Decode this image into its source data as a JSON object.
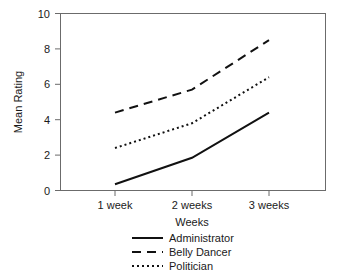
{
  "chart_data": {
    "type": "line",
    "title": "",
    "xlabel": "Weeks",
    "ylabel": "Mean Rating",
    "categories": [
      "1 week",
      "2 weeks",
      "3 weeks"
    ],
    "ylim": [
      0,
      10
    ],
    "yticks": [
      0,
      2,
      4,
      6,
      8,
      10
    ],
    "ytick_labels": [
      "0",
      "2",
      "4",
      "6",
      "8",
      "10"
    ],
    "grid": false,
    "legend_position": "bottom-center",
    "series": [
      {
        "name": "Administrator",
        "values": [
          0.35,
          1.85,
          4.4
        ],
        "style": "solid",
        "color": "#111111"
      },
      {
        "name": "Belly Dancer",
        "values": [
          4.4,
          5.7,
          8.5
        ],
        "style": "dashed",
        "color": "#111111"
      },
      {
        "name": "Politician",
        "values": [
          2.4,
          3.8,
          6.4
        ],
        "style": "dotted",
        "color": "#111111"
      }
    ]
  },
  "axes": {
    "y_label": "Mean Rating",
    "x_label": "Weeks",
    "y_tick_0": "0",
    "y_tick_2": "2",
    "y_tick_4": "4",
    "y_tick_6": "6",
    "y_tick_8": "8",
    "y_tick_10": "10",
    "x_tick_1": "1 week",
    "x_tick_2": "2 weeks",
    "x_tick_3": "3 weeks"
  },
  "legend": {
    "entry_administrator": "Administrator",
    "entry_belly_dancer": "Belly Dancer",
    "entry_politician": "Politician"
  },
  "colors": {
    "line": "#111111",
    "axis": "#555555",
    "background": "#ffffff"
  }
}
